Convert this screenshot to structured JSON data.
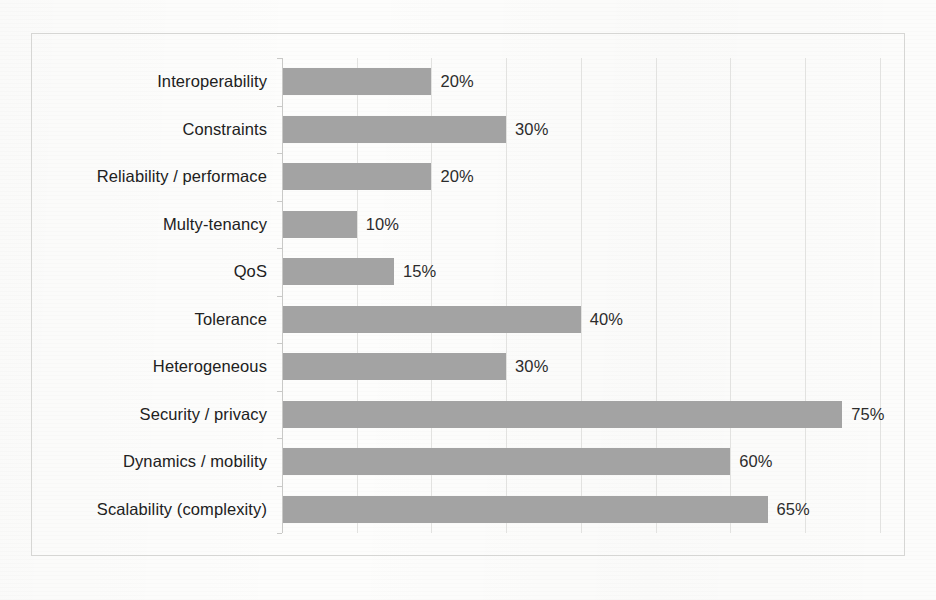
{
  "chart_data": {
    "type": "bar",
    "orientation": "horizontal",
    "title": "",
    "subtitle": "",
    "xlabel": "",
    "ylabel": "",
    "xlim": [
      0,
      85
    ],
    "grid": true,
    "gridline_interval": 10,
    "gridlines": [
      10,
      20,
      30,
      40,
      50,
      60,
      70,
      80
    ],
    "legend": false,
    "tick_labels_x": [],
    "bar_color": "#a3a3a3",
    "label_suffix": "%",
    "categories": [
      "Interoperability",
      "Constraints",
      "Reliability / performace",
      "Multy-tenancy",
      "QoS",
      "Tolerance",
      "Heterogeneous",
      "Security / privacy",
      "Dynamics / mobility",
      "Scalability (complexity)"
    ],
    "values": [
      20,
      30,
      20,
      10,
      15,
      40,
      30,
      75,
      60,
      65
    ],
    "value_labels": [
      "20%",
      "30%",
      "20%",
      "10%",
      "15%",
      "40%",
      "30%",
      "75%",
      "60%",
      "65%"
    ]
  },
  "colors": {
    "bar": "#a3a3a3",
    "frame": "#d6d6d4",
    "gridline": "#e2e2e0",
    "axis": "#c9c9c7",
    "text": "#212121",
    "background": "#fdfdfc"
  }
}
